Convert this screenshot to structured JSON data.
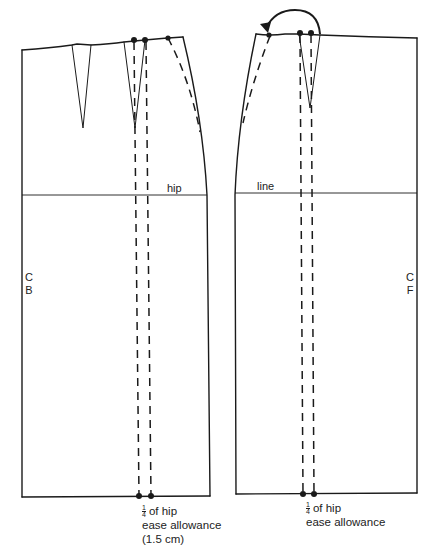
{
  "diagram": {
    "type": "skirt pattern block",
    "colors": {
      "line": "#1a1a1a",
      "background": "#ffffff"
    },
    "back_panel": {
      "center_label": [
        "C",
        "B"
      ],
      "hip_label": "hip",
      "annotation": {
        "fraction_num": "1",
        "fraction_den": "4",
        "line1_rest": "of hip",
        "line2": "ease allowance",
        "line3": "(1.5 cm)"
      }
    },
    "front_panel": {
      "center_label": [
        "C",
        "F"
      ],
      "hip_label": "line",
      "annotation": {
        "fraction_num": "1",
        "fraction_den": "4",
        "line1_rest": "of hip",
        "line2": "ease allowance"
      }
    }
  }
}
